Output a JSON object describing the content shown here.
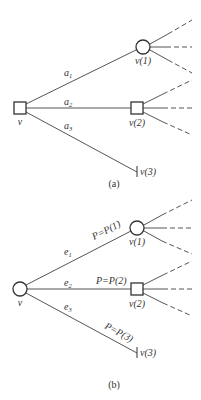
{
  "diagram_a": {
    "caption": "(a)",
    "root": {
      "label": "v",
      "shape": "square"
    },
    "nodes": [
      {
        "id": "v1",
        "label": "v(1)",
        "shape": "circle",
        "edge_label": "a",
        "edge_sub": "1"
      },
      {
        "id": "v2",
        "label": "v(2)",
        "shape": "square",
        "edge_label": "a",
        "edge_sub": "2"
      },
      {
        "id": "v3",
        "label": "v(3)",
        "shape": "terminal",
        "edge_label": "a",
        "edge_sub": "3"
      }
    ]
  },
  "diagram_b": {
    "caption": "(b)",
    "root": {
      "label": "v",
      "shape": "circle"
    },
    "nodes": [
      {
        "id": "v1",
        "label": "v(1)",
        "shape": "circle",
        "edge_label": "e",
        "edge_sub": "1",
        "prob": "P=P(1)"
      },
      {
        "id": "v2",
        "label": "v(2)",
        "shape": "square",
        "edge_label": "e",
        "edge_sub": "2",
        "prob": "P=P(2)"
      },
      {
        "id": "v3",
        "label": "v(3)",
        "shape": "terminal",
        "edge_label": "e",
        "edge_sub": "3",
        "prob": "P=P(3)"
      }
    ]
  },
  "colors": {
    "line": "#555555",
    "node_stroke": "#333333",
    "text": "#333333",
    "background": "#ffffff"
  }
}
